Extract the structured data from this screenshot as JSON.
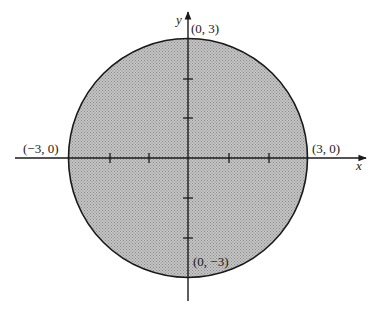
{
  "diagram": {
    "type": "filled-disk",
    "center": [
      0,
      0
    ],
    "radius": 3,
    "fill_color": "#b0b0b0",
    "stroke_color": "#1a1a1a",
    "axes": {
      "x_label": "x",
      "y_label": "y",
      "x_ticks": [
        -2,
        -1,
        1,
        2
      ],
      "y_ticks": [
        -2,
        -1,
        1,
        2
      ]
    },
    "point_labels": {
      "top": "(0, 3)",
      "left": "(−3, 0)",
      "right": "(3, 0)",
      "bottom": "(0, −3)"
    }
  }
}
